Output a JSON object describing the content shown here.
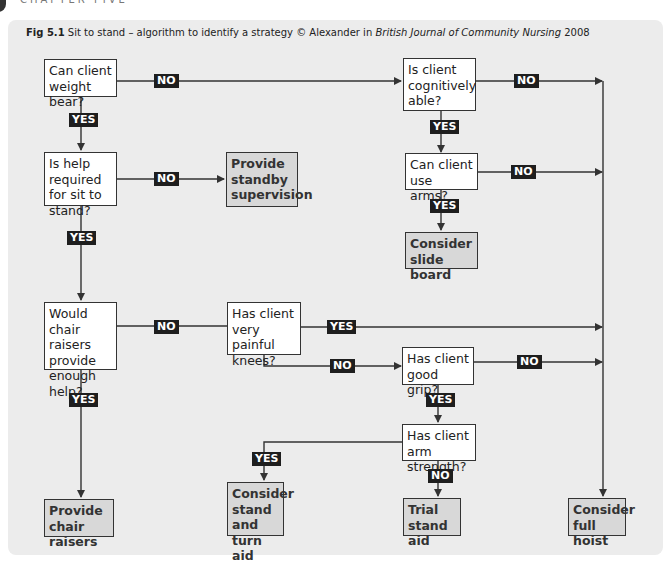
{
  "chapter": {
    "label": "CHAPTER FIVE"
  },
  "figure": {
    "number": "Fig 5.1",
    "title": "Sit to stand – algorithm to identify a strategy © Alexander in",
    "source_journal": "British Journal of Community Nursing",
    "year": "2008"
  },
  "colors": {
    "panel_bg": "#ececec",
    "question_bg": "#ffffff",
    "action_bg": "#d8d8d8",
    "label_bg": "#1e1e1e",
    "line": "#333333"
  },
  "nodes": {
    "weight_bear": "Can client weight bear?",
    "help_required": "Is help required for sit to stand?",
    "standby": "Provide standby supervision",
    "chair_raisers_q": "Would chair raisers provide enough help?",
    "chair_raisers_a": "Provide chair raisers",
    "cognitive": "Is client cognitively able?",
    "use_arms": "Can client use arms?",
    "slide_board": "Consider slide board",
    "painful_knees": "Has client very painful knees?",
    "good_grip": "Has client good grip?",
    "arm_strength": "Has client arm strength?",
    "stand_turn": "Consider stand and turn aid",
    "trial_stand": "Trial stand aid",
    "full_hoist": "Consider full hoist"
  },
  "labels": {
    "yes": "YES",
    "no": "NO"
  }
}
